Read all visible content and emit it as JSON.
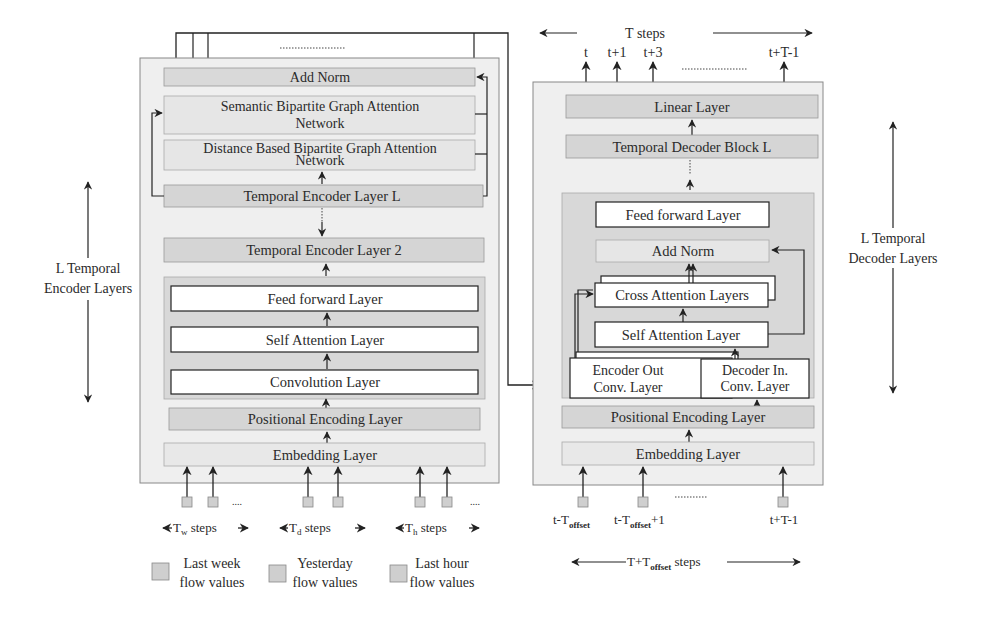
{
  "encoder": {
    "add_norm": "Add Norm",
    "semantic_gat_line1": "Semantic Bipartite Graph Attention",
    "semantic_gat_line2": "Network",
    "distance_gat_line1": "Distance Based Bipartite Graph Attention",
    "distance_gat_line2": "Network",
    "layer_L": "Temporal Encoder Layer L",
    "layer_2": "Temporal Encoder Layer 2",
    "feed_forward": "Feed forward Layer",
    "self_attention": "Self Attention Layer",
    "convolution": "Convolution Layer",
    "positional": "Positional Encoding Layer",
    "embedding": "Embedding Layer",
    "side_label_line1": "L Temporal",
    "side_label_line2": "Encoder Layers",
    "steps": {
      "week": {
        "prefix": "T",
        "sub": "w",
        "suffix": " steps"
      },
      "day": {
        "prefix": "T",
        "sub": "d",
        "suffix": " steps"
      },
      "hour": {
        "prefix": "T",
        "sub": "h",
        "suffix": " steps"
      }
    },
    "legend": {
      "week_line1": "Last week",
      "week_line2": "flow values",
      "day_line1": "Yesterday",
      "day_line2": "flow values",
      "hour_line1": "Last hour",
      "hour_line2": "flow values"
    },
    "ellipsis": "...."
  },
  "decoder": {
    "output_steps_label": "T steps",
    "outputs": [
      "t",
      "t+1",
      "t+3",
      "t+T-1"
    ],
    "linear": "Linear Layer",
    "block_L": "Temporal Decoder Block L",
    "feed_forward": "Feed forward Layer",
    "add_norm": "Add Norm",
    "cross_attention": "Cross Attention Layers",
    "self_attention": "Self Attention Layer",
    "encoder_out_conv_line1": "Encoder Out",
    "encoder_out_conv_line2": "Conv. Layer",
    "decoder_in_conv_line1": "Decoder In.",
    "decoder_in_conv_line2": "Conv. Layer",
    "positional": "Positional Encoding Layer",
    "embedding": "Embedding Layer",
    "side_label_line1": "L Temporal",
    "side_label_line2": "Decoder Layers",
    "inputs": {
      "first": {
        "prefix": "t-T",
        "sub": "offset",
        "suffix": ""
      },
      "second": {
        "prefix": "t-T",
        "sub": "offset",
        "suffix": "+1"
      },
      "last": "t+T-1"
    },
    "input_steps": {
      "prefix": "T+T",
      "sub": "offset",
      "suffix": " steps"
    }
  }
}
